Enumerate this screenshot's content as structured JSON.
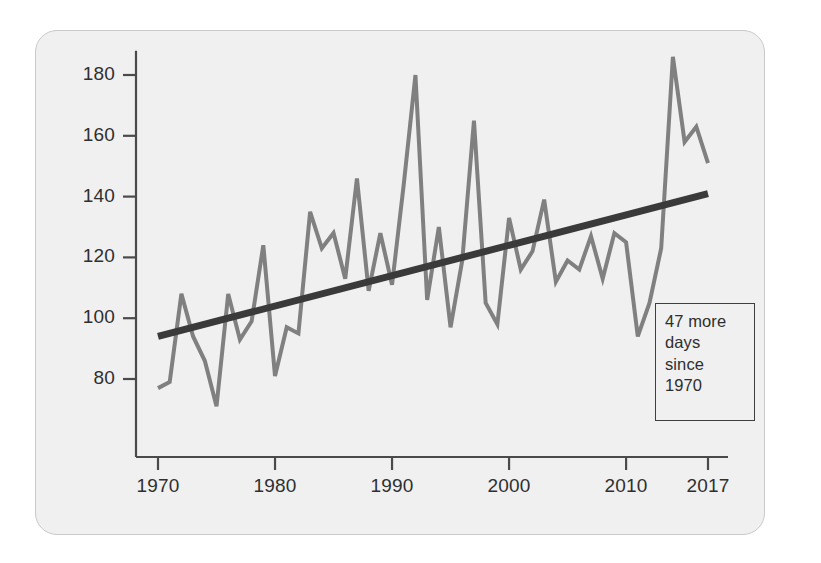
{
  "card": {
    "background": "#f0f0f0",
    "border_color": "#c9c9c9"
  },
  "annotation": {
    "line1": "47 more",
    "line2": "days",
    "line3": "since",
    "line4": "1970"
  },
  "chart_data": {
    "type": "line",
    "title": "",
    "subtitle": "",
    "xlabel": "",
    "ylabel": "",
    "grid": false,
    "legend": "none",
    "xlim": [
      1970,
      2017
    ],
    "ylim": [
      66,
      190
    ],
    "xticks": [
      1970,
      1980,
      1990,
      2000,
      2010,
      2017
    ],
    "xtick_labels": [
      "1970",
      "1980",
      "1990",
      "2000",
      "2010",
      "2017"
    ],
    "yticks": [
      80,
      100,
      120,
      140,
      160,
      180
    ],
    "ytick_labels": [
      "80",
      "100",
      "120",
      "140",
      "160",
      "180"
    ],
    "annotations": [
      {
        "text": "47 more days since 1970",
        "x": 2012,
        "y": 95,
        "boxed": true
      }
    ],
    "series": [
      {
        "name": "Annual value",
        "color": "#808080",
        "linewidth": 4,
        "x": [
          1970,
          1971,
          1972,
          1973,
          1974,
          1975,
          1976,
          1977,
          1978,
          1979,
          1980,
          1981,
          1982,
          1983,
          1984,
          1985,
          1986,
          1987,
          1988,
          1989,
          1990,
          1991,
          1992,
          1993,
          1994,
          1995,
          1996,
          1997,
          1998,
          1999,
          2000,
          2001,
          2002,
          2003,
          2004,
          2005,
          2006,
          2007,
          2008,
          2009,
          2010,
          2011,
          2012,
          2013,
          2014,
          2015,
          2016,
          2017
        ],
        "values": [
          77,
          79,
          108,
          94,
          86,
          71,
          108,
          93,
          99,
          124,
          81,
          97,
          95,
          135,
          123,
          128,
          113,
          146,
          109,
          128,
          111,
          144,
          180,
          106,
          130,
          97,
          119,
          165,
          105,
          98,
          133,
          116,
          122,
          139,
          112,
          119,
          116,
          127,
          113,
          128,
          125,
          94,
          105,
          123,
          186,
          158,
          163,
          151
        ]
      },
      {
        "name": "Trend",
        "color": "#3a3a3a",
        "linewidth": 7,
        "x": [
          1970,
          2017
        ],
        "values": [
          94,
          141
        ]
      }
    ]
  }
}
